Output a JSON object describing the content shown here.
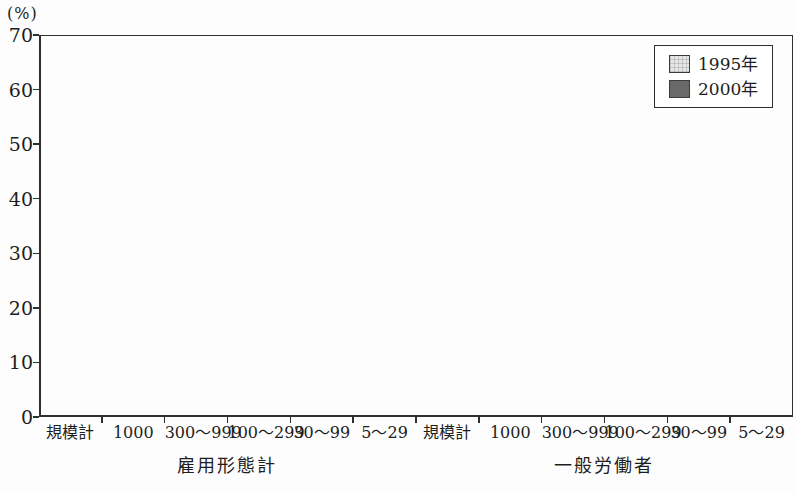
{
  "figure": {
    "unit_label": "(%)"
  },
  "chart_data": {
    "type": "bar",
    "title": "",
    "ylabel": "(%)",
    "ylim": [
      0,
      70
    ],
    "yticks": [
      0,
      10,
      20,
      30,
      40,
      50,
      60,
      70
    ],
    "grid": false,
    "legend_position": "top-right",
    "group_labels": [
      "雇用形態計",
      "一般労働者"
    ],
    "categories": [
      "規模計",
      "1000",
      "300〜999",
      "100〜299",
      "30〜99",
      "5〜29",
      "規模計",
      "1000",
      "300〜999",
      "100〜299",
      "30〜99",
      "5〜29"
    ],
    "series": [
      {
        "name": "1995年",
        "color": "#e9e9e9",
        "values": [
          43.3,
          51.9,
          53.6,
          50.2,
          36.6,
          37.0,
          45.6,
          54.3,
          60.0,
          53.0,
          39.8,
          38.7
        ]
      },
      {
        "name": "2000年",
        "color": "#696969",
        "values": [
          39.0,
          43.8,
          38.7,
          37.9,
          35.9,
          39.4,
          38.3,
          40.1,
          43.4,
          38.1,
          37.0,
          36.7
        ]
      }
    ]
  }
}
